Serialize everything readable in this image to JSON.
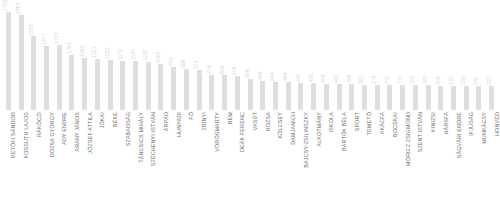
{
  "chart_data": {
    "type": "bar",
    "title": "",
    "subtitle": "",
    "xlabel": "",
    "ylabel": "",
    "grid": false,
    "legend": false,
    "ylim": [
      0,
      2792
    ],
    "orientation": "vertical",
    "bar_color": "#dedede",
    "value_label_color": "#d8d8d8",
    "category_label_color": "#6e6e6e",
    "categories": [
      "PETŐFI SÁNDOR",
      "KOSSUTH LAJOS",
      "RÁKÓCZI",
      "DÓZSA GYÖRGY",
      "ADY ENDRE",
      "ARANY JÁNOS",
      "JÓZSEF ATTILA",
      "JÓKAI",
      "BÉKE",
      "SZABADSÁG",
      "TÁNCSICS MIHÁLY",
      "SZÉCHENYI ISTVÁN",
      "ÁRPÁD",
      "HUNYADI",
      "FŐ",
      "ZRÍNYI",
      "VÖRÖSMARTY",
      "BEM",
      "DEÁK FERENC",
      "VASÚT",
      "RÓZSA",
      "KÖLCSEY",
      "DAMJANICH",
      "BAJCSY-ZSILINSZKY",
      "ALKOTMÁNY",
      "ISKOLA",
      "BARTÓK BÉLA",
      "SPORT",
      "TEMETŐ",
      "AKÁCFA",
      "BOCSKAI",
      "MÓRICZ ZSIGMOND",
      "SZENT ISTVÁN",
      "KINIZSI",
      "HÁRSFA",
      "SÁGVÁRI ENDRE",
      "IFJÚSÁG",
      "MUNKÁCSY",
      "HONVÉD"
    ],
    "values": [
      2792,
      2683,
      2008,
      1677,
      1701,
      1354,
      1263,
      1223,
      1213,
      1172,
      1155,
      1128,
      1069,
      951,
      886,
      871,
      704,
      699,
      659,
      556,
      484,
      464,
      464,
      442,
      431,
      404,
      400,
      388,
      381,
      379,
      370,
      377,
      353,
      353,
      338,
      337,
      335,
      330,
      320
    ],
    "value_labels": [
      "2792",
      "2683",
      "2008",
      "1677",
      "1701",
      "1354",
      "1263",
      "1223",
      "1213",
      "1172",
      "1155",
      "1128",
      "1069",
      "951",
      "886",
      "871",
      "704",
      "699",
      "659",
      "556",
      "484",
      "464",
      "464",
      "442",
      "431",
      "404",
      "400",
      "388",
      "381",
      "379",
      "370",
      "377",
      "353",
      "353",
      "338",
      "337",
      "335",
      "330",
      "320"
    ]
  }
}
